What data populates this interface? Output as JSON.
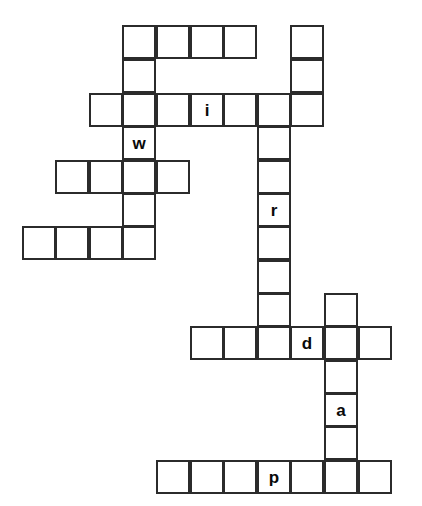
{
  "puzzle": {
    "type": "crossword-grid",
    "title": "Crossword puzzle grid",
    "style": {
      "background_color": "#ffffff",
      "cell_border_color": "#2b2b2b",
      "letter_color": "#0a0a0a",
      "cell_fill_color": "#ffffff"
    },
    "geometry": {
      "cell_size": 34,
      "border_width": 2,
      "columns_x": [
        22,
        55,
        89,
        122,
        156,
        190,
        223,
        257,
        290,
        324,
        358
      ],
      "rows_y": [
        25,
        59,
        93,
        126,
        160,
        193,
        226,
        260,
        293,
        326,
        360,
        393,
        426,
        460
      ]
    },
    "filled_letters": [
      "i",
      "w",
      "r",
      "d",
      "a",
      "p"
    ],
    "letter_count": 6,
    "cell_count": 54,
    "cells": [
      {
        "col": 3,
        "row": 0,
        "letter": ""
      },
      {
        "col": 4,
        "row": 0,
        "letter": ""
      },
      {
        "col": 5,
        "row": 0,
        "letter": ""
      },
      {
        "col": 6,
        "row": 0,
        "letter": ""
      },
      {
        "col": 8,
        "row": 0,
        "letter": ""
      },
      {
        "col": 3,
        "row": 1,
        "letter": ""
      },
      {
        "col": 8,
        "row": 1,
        "letter": ""
      },
      {
        "col": 2,
        "row": 2,
        "letter": ""
      },
      {
        "col": 3,
        "row": 2,
        "letter": ""
      },
      {
        "col": 4,
        "row": 2,
        "letter": ""
      },
      {
        "col": 5,
        "row": 2,
        "letter": "i"
      },
      {
        "col": 6,
        "row": 2,
        "letter": ""
      },
      {
        "col": 7,
        "row": 2,
        "letter": ""
      },
      {
        "col": 8,
        "row": 2,
        "letter": ""
      },
      {
        "col": 3,
        "row": 3,
        "letter": "w"
      },
      {
        "col": 7,
        "row": 3,
        "letter": ""
      },
      {
        "col": 1,
        "row": 4,
        "letter": ""
      },
      {
        "col": 2,
        "row": 4,
        "letter": ""
      },
      {
        "col": 3,
        "row": 4,
        "letter": ""
      },
      {
        "col": 4,
        "row": 4,
        "letter": ""
      },
      {
        "col": 7,
        "row": 4,
        "letter": ""
      },
      {
        "col": 3,
        "row": 5,
        "letter": ""
      },
      {
        "col": 7,
        "row": 5,
        "letter": "r"
      },
      {
        "col": 0,
        "row": 6,
        "letter": ""
      },
      {
        "col": 1,
        "row": 6,
        "letter": ""
      },
      {
        "col": 2,
        "row": 6,
        "letter": ""
      },
      {
        "col": 3,
        "row": 6,
        "letter": ""
      },
      {
        "col": 7,
        "row": 6,
        "letter": ""
      },
      {
        "col": 7,
        "row": 7,
        "letter": ""
      },
      {
        "col": 7,
        "row": 8,
        "letter": ""
      },
      {
        "col": 9,
        "row": 8,
        "letter": ""
      },
      {
        "col": 5,
        "row": 9,
        "letter": ""
      },
      {
        "col": 6,
        "row": 9,
        "letter": ""
      },
      {
        "col": 7,
        "row": 9,
        "letter": ""
      },
      {
        "col": 8,
        "row": 9,
        "letter": "d"
      },
      {
        "col": 9,
        "row": 9,
        "letter": ""
      },
      {
        "col": 10,
        "row": 9,
        "letter": ""
      },
      {
        "col": 9,
        "row": 10,
        "letter": ""
      },
      {
        "col": 9,
        "row": 11,
        "letter": "a"
      },
      {
        "col": 9,
        "row": 12,
        "letter": ""
      },
      {
        "col": 4,
        "row": 13,
        "letter": ""
      },
      {
        "col": 5,
        "row": 13,
        "letter": ""
      },
      {
        "col": 6,
        "row": 13,
        "letter": ""
      },
      {
        "col": 7,
        "row": 13,
        "letter": "p"
      },
      {
        "col": 8,
        "row": 13,
        "letter": ""
      },
      {
        "col": 9,
        "row": 13,
        "letter": ""
      },
      {
        "col": 10,
        "row": 13,
        "letter": ""
      }
    ]
  }
}
